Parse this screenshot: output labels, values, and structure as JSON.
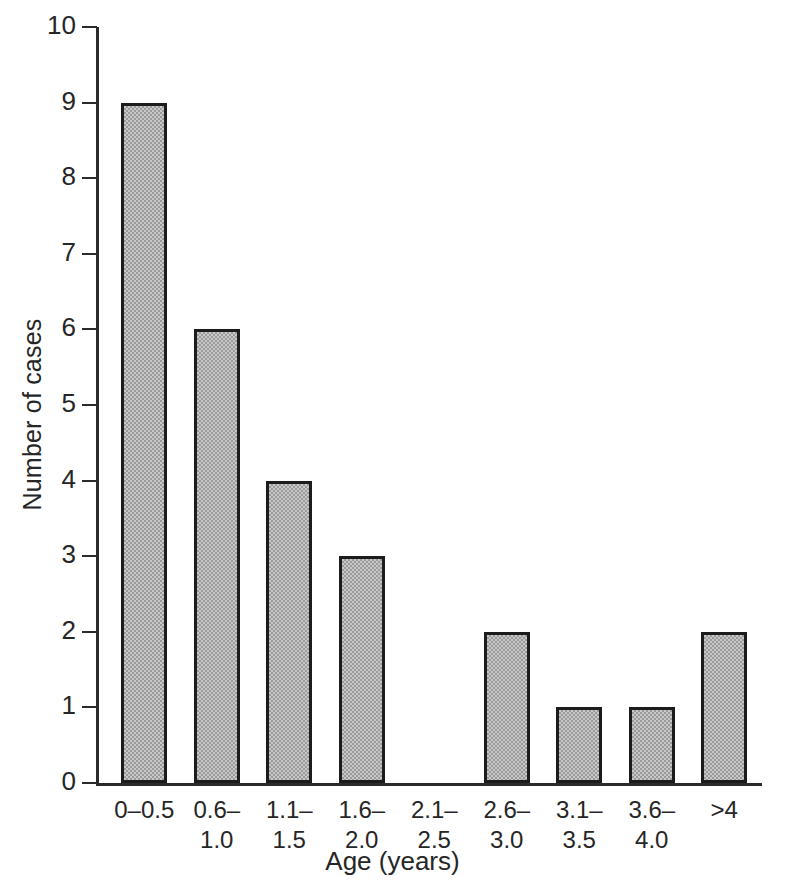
{
  "chart_data": {
    "type": "bar",
    "title": "",
    "xlabel": "Age (years)",
    "ylabel": "Number of cases",
    "categories": [
      "0–0.5",
      "0.6–1.0",
      "1.1–1.5",
      "1.6–2.0",
      "2.1–\n2.5",
      "2.6–\n3.0",
      "3.1–\n3.5",
      "3.6–\n4.0",
      ">4"
    ],
    "values": [
      9,
      6,
      4,
      3,
      0,
      2,
      1,
      1,
      2
    ],
    "ylim": [
      0,
      10
    ],
    "ytick_labels": [
      "10",
      "9",
      "8",
      "7",
      "6",
      "5",
      "4",
      "3",
      "2",
      "1",
      "0"
    ],
    "ytick_values": [
      10,
      9,
      8,
      7,
      6,
      5,
      4,
      3,
      2,
      1,
      0
    ],
    "grid": false,
    "legend": false,
    "bar_fill_color": "#c8c8c8",
    "bar_edge_color": "#1c1c1c",
    "background_color": "#ffffff",
    "axis_color": "#2b2b2b"
  }
}
